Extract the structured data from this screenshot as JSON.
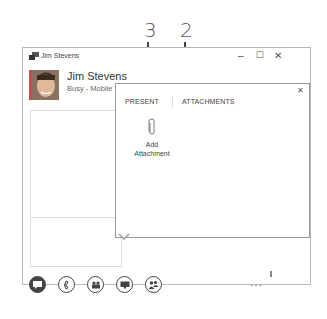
{
  "callouts": [
    {
      "number": "3",
      "target": "add-attachment"
    },
    {
      "number": "2",
      "target": "attachments-tab"
    }
  ],
  "window": {
    "title": "Jim Stevens",
    "controls": {
      "minimize": "–",
      "maximize": "☐",
      "close": "✕"
    }
  },
  "contact": {
    "name": "Jim Stevens",
    "status": "Busy - Mobile",
    "presence_color": "#c0504d"
  },
  "flyout": {
    "close": "✕",
    "tabs": [
      {
        "label": "PRESENT"
      },
      {
        "label": "ATTACHMENTS"
      }
    ],
    "add_attachment": {
      "line1": "Add",
      "line2": "Attachment",
      "icon": "paperclip-icon"
    }
  },
  "toolbar": {
    "buttons": [
      {
        "name": "im",
        "icon": "chat-bubble-icon",
        "active": true
      },
      {
        "name": "call",
        "icon": "phone-icon",
        "active": false
      },
      {
        "name": "video",
        "icon": "video-camera-icon",
        "active": false
      },
      {
        "name": "present",
        "icon": "monitor-icon",
        "active": false
      },
      {
        "name": "participants",
        "icon": "people-icon",
        "active": false
      }
    ],
    "more": "···"
  }
}
